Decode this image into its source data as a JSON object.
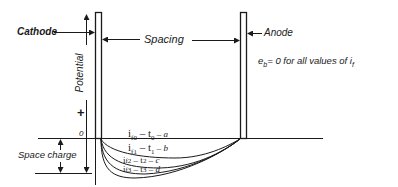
{
  "diagram": {
    "type": "space-charge potential diagram between cathode and anode",
    "labels": {
      "cathode": "Cathode",
      "anode": "Anode",
      "spacing": "Spacing",
      "potential": "Potential",
      "plus_sign": "+",
      "zero": "0",
      "space_charge": "Space charge",
      "condition": "e_b = 0 for all values of i_f"
    },
    "condition_parts": {
      "e": "e",
      "b_sub": "b",
      "rest": "= 0 for all values of ",
      "i": "i",
      "f_sub": "f"
    },
    "curves": [
      {
        "label": "i_f0 – t_0 – a",
        "main": "i",
        "sub": "f0",
        "mid": " – t",
        "sub2": "0",
        "end": " – a"
      },
      {
        "label": "i_f1 – t_1 – b",
        "main": "i",
        "sub": "f1",
        "mid": " – t",
        "sub2": "1",
        "end": " – b"
      },
      {
        "label": "i_f2 – t_2 – c",
        "main": "i",
        "sub": "f2",
        "mid": " – t",
        "sub2": "2",
        "end": " – c"
      },
      {
        "label": "i_f3 – t_3 – d",
        "main": "i",
        "sub": "f3",
        "mid": " – t",
        "sub2": "3",
        "end": " – d"
      }
    ],
    "colors": {
      "ink": "#1a1a1a",
      "background": "#ffffff"
    }
  }
}
